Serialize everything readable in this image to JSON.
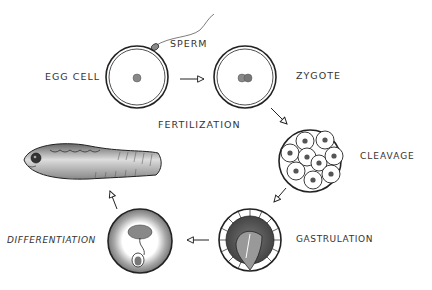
{
  "diagram": {
    "type": "life-cycle flow",
    "stages": [
      {
        "id": "egg",
        "label": "EGG CELL"
      },
      {
        "id": "zygote",
        "label": "ZYGOTE"
      },
      {
        "id": "cleavage",
        "label": "CLEAVAGE"
      },
      {
        "id": "gastrulation",
        "label": "GASTRULATION"
      },
      {
        "id": "differentiation",
        "label": "DIFFERENTIATION"
      },
      {
        "id": "larva",
        "label": ""
      }
    ],
    "annotations": {
      "sperm": "SPERM",
      "fertilization": "FERTILIZATION"
    },
    "edges": [
      {
        "from": "egg",
        "to": "zygote"
      },
      {
        "from": "zygote",
        "to": "cleavage"
      },
      {
        "from": "cleavage",
        "to": "gastrulation"
      },
      {
        "from": "gastrulation",
        "to": "differentiation"
      },
      {
        "from": "differentiation",
        "to": "larva"
      }
    ],
    "colors": {
      "ink": "#222222",
      "nucleus": "#777777",
      "shade_dark": "#555555",
      "shade_mid": "#999999",
      "background": "#ffffff"
    }
  }
}
